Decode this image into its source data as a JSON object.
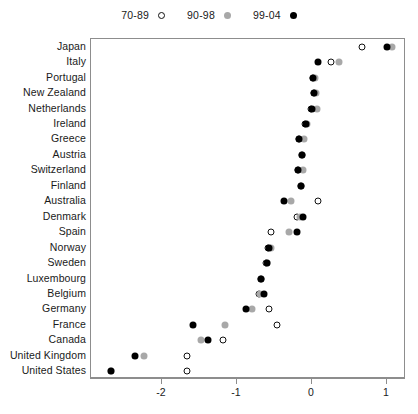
{
  "chart_data": {
    "type": "scatter",
    "title": "",
    "subtitle": "",
    "xlabel": "",
    "ylabel": "",
    "xlim": [
      -2.95,
      1.25
    ],
    "ylim": [
      0,
      23
    ],
    "grid": false,
    "legend_position": "top-center",
    "xticks": [
      -2,
      -1,
      0,
      1
    ],
    "xticklabels": [
      "-2",
      "-1",
      "0",
      "1"
    ],
    "legend": [
      {
        "name": "70-89",
        "marker": "open-circle",
        "color": "#ffffff",
        "edge": "#111111"
      },
      {
        "name": "90-98",
        "marker": "filled-circle",
        "color": "#a8a8a8",
        "edge": "#a8a8a8"
      },
      {
        "name": "99-04",
        "marker": "filled-circle",
        "color": "#000000",
        "edge": "#000000"
      }
    ],
    "categories": [
      "Japan",
      "Italy",
      "Portugal",
      "New Zealand",
      "Netherlands",
      "Ireland",
      "Greece",
      "Austria",
      "Switzerland",
      "Finland",
      "Australia",
      "Denmark",
      "Spain",
      "Norway",
      "Sweden",
      "Luxembourg",
      "Belgium",
      "Germany",
      "France",
      "Canada",
      "United Kingdom",
      "United States"
    ],
    "series": [
      {
        "name": "70-89",
        "marker": "open-circle",
        "values": [
          0.67,
          0.25,
          0.01,
          0.03,
          -0.01,
          -0.09,
          -0.17,
          -0.13,
          -0.19,
          -0.15,
          0.08,
          -0.2,
          -0.55,
          -0.59,
          -0.61,
          -0.68,
          -0.71,
          -0.57,
          -0.47,
          -1.19,
          -1.67,
          -1.67
        ]
      },
      {
        "name": "90-98",
        "marker": "filled-circle",
        "values": [
          1.07,
          0.36,
          0.04,
          0.05,
          0.07,
          -0.07,
          -0.11,
          -0.13,
          -0.12,
          -0.15,
          -0.28,
          -0.16,
          -0.31,
          -0.55,
          -0.6,
          -0.68,
          -0.69,
          -0.8,
          -1.16,
          -1.48,
          -2.24,
          -2.68
        ]
      },
      {
        "name": "99-04",
        "marker": "filled-circle",
        "values": [
          1.0,
          0.08,
          0.01,
          0.03,
          0.0,
          -0.08,
          -0.17,
          -0.13,
          -0.19,
          -0.15,
          -0.37,
          -0.12,
          -0.2,
          -0.57,
          -0.6,
          -0.68,
          -0.64,
          -0.88,
          -1.59,
          -1.39,
          -2.36,
          -2.68
        ]
      }
    ]
  }
}
